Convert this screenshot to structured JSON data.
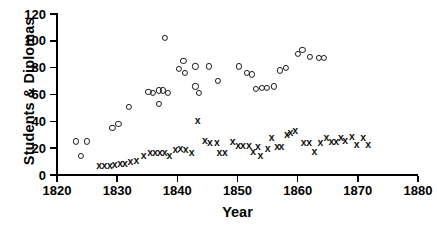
{
  "chart_data": {
    "type": "scatter",
    "title": "",
    "xlabel": "Year",
    "ylabel": "Students & Diplomas",
    "xlim": [
      1820,
      1880
    ],
    "ylim": [
      0,
      120
    ],
    "xticks": [
      1820,
      1830,
      1840,
      1850,
      1860,
      1870,
      1880
    ],
    "yticks": [
      0,
      20,
      40,
      60,
      80,
      100,
      120
    ],
    "grid": false,
    "legend": "none",
    "series": [
      {
        "name": "Students",
        "marker": "open-circle",
        "color": "#1a1a1a",
        "points": [
          [
            1823.2,
            25
          ],
          [
            1825.0,
            25
          ],
          [
            1824.0,
            14
          ],
          [
            1829.2,
            35
          ],
          [
            1830.2,
            38
          ],
          [
            1832.0,
            51
          ],
          [
            1835.2,
            62
          ],
          [
            1836.0,
            61
          ],
          [
            1836.9,
            63
          ],
          [
            1837.6,
            63
          ],
          [
            1837.0,
            53
          ],
          [
            1838.5,
            61
          ],
          [
            1838.0,
            102
          ],
          [
            1841.0,
            85
          ],
          [
            1840.2,
            79
          ],
          [
            1841.3,
            76
          ],
          [
            1843.0,
            81
          ],
          [
            1845.2,
            81
          ],
          [
            1843.0,
            66
          ],
          [
            1843.6,
            61
          ],
          [
            1846.8,
            70
          ],
          [
            1850.2,
            81
          ],
          [
            1851.5,
            76
          ],
          [
            1852.4,
            75
          ],
          [
            1853.0,
            64
          ],
          [
            1854.1,
            65
          ],
          [
            1854.9,
            65
          ],
          [
            1856.0,
            66
          ],
          [
            1857.0,
            78
          ],
          [
            1858.0,
            80
          ],
          [
            1860.0,
            90
          ],
          [
            1860.8,
            93
          ],
          [
            1862.0,
            88
          ],
          [
            1863.5,
            87
          ],
          [
            1864.3,
            87
          ]
        ]
      },
      {
        "name": "Diplomas",
        "marker": "cross",
        "color": "#111111",
        "points": [
          [
            1827.0,
            8
          ],
          [
            1827.9,
            8
          ],
          [
            1828.8,
            8
          ],
          [
            1829.6,
            9
          ],
          [
            1830.5,
            10
          ],
          [
            1831.3,
            10
          ],
          [
            1832.2,
            11
          ],
          [
            1833.2,
            12
          ],
          [
            1834.4,
            16
          ],
          [
            1835.5,
            18
          ],
          [
            1836.3,
            18
          ],
          [
            1837.1,
            18
          ],
          [
            1837.9,
            18
          ],
          [
            1838.7,
            16
          ],
          [
            1839.7,
            20
          ],
          [
            1840.5,
            21
          ],
          [
            1841.4,
            20
          ],
          [
            1842.4,
            18
          ],
          [
            1843.4,
            42
          ],
          [
            1844.6,
            27
          ],
          [
            1845.4,
            25
          ],
          [
            1846.6,
            25
          ],
          [
            1847.0,
            18
          ],
          [
            1847.9,
            18
          ],
          [
            1849.2,
            26
          ],
          [
            1850.1,
            23
          ],
          [
            1850.9,
            23
          ],
          [
            1851.9,
            23
          ],
          [
            1852.6,
            19
          ],
          [
            1853.4,
            22
          ],
          [
            1853.8,
            16
          ],
          [
            1855.0,
            21
          ],
          [
            1855.7,
            29
          ],
          [
            1856.6,
            22
          ],
          [
            1857.3,
            22
          ],
          [
            1858.2,
            31
          ],
          [
            1858.8,
            33
          ],
          [
            1859.6,
            34
          ],
          [
            1861.0,
            25
          ],
          [
            1861.9,
            25
          ],
          [
            1862.8,
            19
          ],
          [
            1863.8,
            25
          ],
          [
            1864.8,
            29
          ],
          [
            1865.6,
            26
          ],
          [
            1866.4,
            26
          ],
          [
            1867.2,
            29
          ],
          [
            1867.9,
            27
          ],
          [
            1869.0,
            30
          ],
          [
            1869.8,
            24
          ],
          [
            1870.9,
            29
          ],
          [
            1871.7,
            24
          ]
        ]
      }
    ]
  },
  "axes": {
    "x_tick_labels": [
      "1820",
      "1830",
      "1840",
      "1850",
      "1860",
      "1870",
      "1880"
    ],
    "y_tick_labels": [
      "0",
      "20",
      "40",
      "60",
      "80",
      "100",
      "120"
    ],
    "x_title": "Year",
    "y_title": "Students & Diplomas"
  }
}
